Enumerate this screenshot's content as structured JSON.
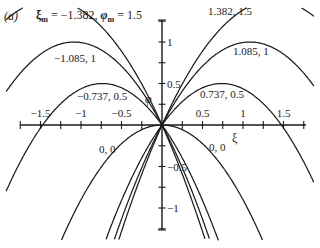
{
  "panel_label": "(a)",
  "title": "ξm = −1.382, φm = 1.5",
  "chart_data": {
    "type": "line",
    "panel": "(a)",
    "xlabel": "ξ",
    "ylabel": "φ",
    "xlim": [
      -2.0,
      1.95
    ],
    "ylim": [
      -1.3,
      1.5
    ],
    "x_ticks": [
      -1.75,
      -1.5,
      -1.25,
      -1,
      -0.75,
      -0.5,
      -0.25,
      0.25,
      0.5,
      0.75,
      1,
      1.25,
      1.5,
      1.75
    ],
    "x_tick_labels": [
      "-1.5",
      "-1",
      "-0.5",
      "0.5",
      "1",
      "1.5"
    ],
    "y_ticks": [
      1.25,
      1,
      0.75,
      0.5,
      0.25,
      -0.25,
      -0.5,
      -0.75,
      -1,
      -1.25
    ],
    "y_tick_labels": [
      "1",
      "0.5",
      "-0.5",
      "-1"
    ],
    "grid": false,
    "legend": "none (curves labelled inline)",
    "series": [
      {
        "name": "-1.382, 1.5",
        "xi_m": -1.382,
        "phi_m": 1.5,
        "label": "ξm = −1.382, φm = 1.5"
      },
      {
        "name": "-1.085, 1",
        "xi_m": -1.085,
        "phi_m": 1,
        "label": "−1.085, 1"
      },
      {
        "name": "-0.737, 0.5",
        "xi_m": -0.737,
        "phi_m": 0.5,
        "label": "−0.737, 0.5"
      },
      {
        "name": "0, 0 (left)",
        "xi_m": 0,
        "phi_m": 0,
        "label": "0, 0"
      },
      {
        "name": "0, 0 (right)",
        "xi_m": 0,
        "phi_m": 0,
        "label": "0, 0"
      },
      {
        "name": "0.737, 0.5",
        "xi_m": 0.737,
        "phi_m": 0.5,
        "label": "0.737, 0.5"
      },
      {
        "name": "1.085, 1",
        "xi_m": 1.085,
        "phi_m": 1,
        "label": "1.085, 1"
      },
      {
        "name": "1.382, 1.5",
        "xi_m": 1.382,
        "phi_m": 1.5,
        "label": "1.382, 1.5"
      }
    ],
    "zero_curve_coefficient": 0.9,
    "annotations": [
      "(a)",
      "ξm = −1.382, φm = 1.5",
      "1.382, 1.5",
      "−1.085, 1",
      "1.085, 1",
      "−0.737, 0.5",
      "0.737, 0.5",
      "0, 0",
      "0, 0"
    ]
  },
  "axes": {
    "x_label": "ξ",
    "y_label": "φ",
    "x_tick_labels": [
      {
        "value": -1.5,
        "text": "−1.5"
      },
      {
        "value": -1,
        "text": "−1"
      },
      {
        "value": -0.5,
        "text": "−0.5"
      },
      {
        "value": 0.5,
        "text": "0.5"
      },
      {
        "value": 1,
        "text": "1"
      },
      {
        "value": 1.5,
        "text": "1.5"
      }
    ],
    "y_tick_labels": [
      {
        "value": 1,
        "text": "1"
      },
      {
        "value": 0.5,
        "text": "0.5"
      },
      {
        "value": -0.5,
        "text": "−0.5"
      },
      {
        "value": -1,
        "text": "−1"
      }
    ]
  },
  "labels": {
    "top_right": "1.382, 1.5",
    "left_1": "−1.085, 1",
    "right_1": "1.085, 1",
    "left_05": "−0.737, 0.5",
    "right_05": "0.737, 0.5",
    "left_00": "0, 0",
    "right_00": "0, 0"
  }
}
